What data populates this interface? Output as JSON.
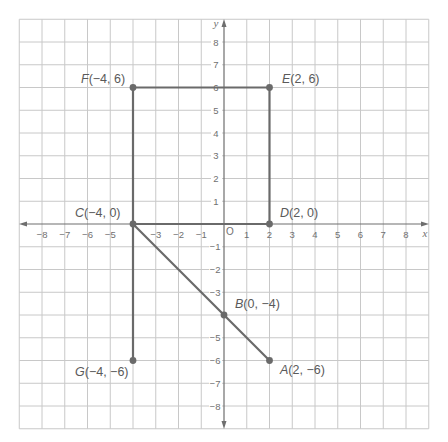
{
  "diagram": {
    "type": "coordinate_plane",
    "x_axis": {
      "label": "x",
      "min": -8,
      "max": 8,
      "ticks": [
        "-8",
        "-7",
        "-6",
        "-5",
        "-3",
        "-2",
        "-1",
        "1",
        "2",
        "3",
        "4",
        "5",
        "6",
        "7",
        "8"
      ]
    },
    "y_axis": {
      "label": "y",
      "min": -8,
      "max": 8,
      "ticks": [
        "8",
        "7",
        "6",
        "5",
        "4",
        "3",
        "2",
        "1",
        "-1",
        "-2",
        "-3",
        "-5",
        "-6",
        "-7",
        "-8"
      ]
    },
    "origin_label": "O",
    "grid": {
      "from": -9,
      "to": 9,
      "step": 1
    },
    "colors": {
      "grid": "#c8c8c8",
      "axis": "#6e6e6e",
      "shape": "#6a6a6a",
      "text": "#5a5a5a"
    },
    "points": [
      {
        "name": "F",
        "x": -4,
        "y": 6,
        "label": "(−4, 6)"
      },
      {
        "name": "E",
        "x": 2,
        "y": 6,
        "label": "(2, 6)"
      },
      {
        "name": "C",
        "x": -4,
        "y": 0,
        "label": "(−4, 0)"
      },
      {
        "name": "D",
        "x": 2,
        "y": 0,
        "label": "(2, 0)"
      },
      {
        "name": "B",
        "x": 0,
        "y": -4,
        "label": "(0, −4)"
      },
      {
        "name": "G",
        "x": -4,
        "y": -6,
        "label": "(−4, −6)"
      },
      {
        "name": "A",
        "x": 2,
        "y": -6,
        "label": "(2, −6)"
      }
    ],
    "segments": [
      [
        "F",
        "E"
      ],
      [
        "E",
        "D"
      ],
      [
        "F",
        "C"
      ],
      [
        "C",
        "G"
      ],
      [
        "C",
        "D"
      ],
      [
        "C",
        "B"
      ],
      [
        "B",
        "A"
      ]
    ]
  },
  "labels": {
    "F": {
      "letter": "F",
      "coords": "(−4, 6)"
    },
    "E": {
      "letter": "E",
      "coords": "(2, 6)"
    },
    "C": {
      "letter": "C",
      "coords": "(−4, 0)"
    },
    "D": {
      "letter": "D",
      "coords": "(2, 0)"
    },
    "B": {
      "letter": "B",
      "coords": "(0, −4)"
    },
    "G": {
      "letter": "G",
      "coords": "(−4, −6)"
    },
    "A": {
      "letter": "A",
      "coords": "(2, −6)"
    },
    "x_axis": "x",
    "y_axis": "y",
    "origin": "O"
  },
  "ticks": {
    "x": {
      "n8": "−8",
      "n7": "−7",
      "n6": "−6",
      "n5": "−5",
      "n3": "−3",
      "n2": "−2",
      "n1": "−1",
      "p1": "1",
      "p2": "2",
      "p3": "3",
      "p4": "4",
      "p5": "5",
      "p6": "6",
      "p7": "7",
      "p8": "8"
    },
    "y": {
      "p8": "8",
      "p7": "7",
      "p6": "6",
      "p5": "5",
      "p4": "4",
      "p3": "3",
      "p2": "2",
      "p1": "1",
      "n1": "−1",
      "n2": "−2",
      "n3": "−3",
      "n5": "−5",
      "n6": "−6",
      "n7": "−7",
      "n8": "−8"
    }
  }
}
